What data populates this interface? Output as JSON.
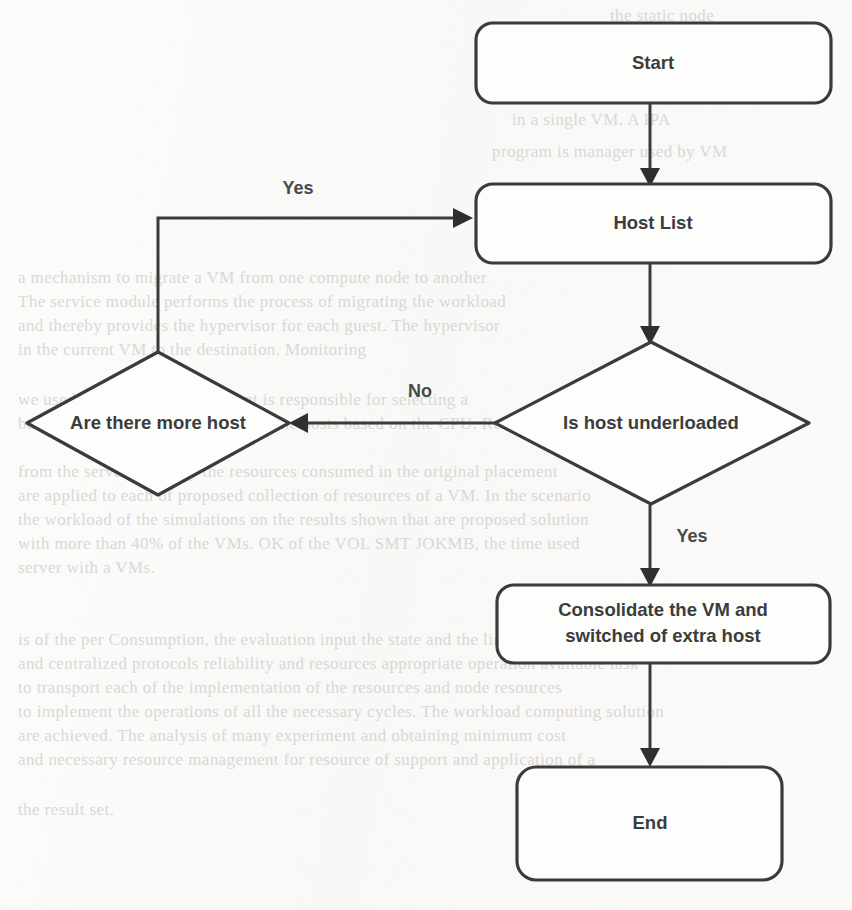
{
  "diagram": {
    "type": "flowchart",
    "background_color": "#fbfbfa",
    "stroke_color": "#3b3b3b",
    "text_color": "#3c3c3c",
    "nodes": [
      {
        "id": "start",
        "shape": "rounded-rectangle",
        "label": "Start"
      },
      {
        "id": "host_list",
        "shape": "rounded-rectangle",
        "label": "Host List"
      },
      {
        "id": "underloaded",
        "shape": "diamond",
        "label": "Is host underloaded"
      },
      {
        "id": "more_host",
        "shape": "diamond",
        "label": "Are there more host"
      },
      {
        "id": "consolidate",
        "shape": "rounded-rectangle",
        "label_line1": "Consolidate the VM and",
        "label_line2": "switched of extra host"
      },
      {
        "id": "end",
        "shape": "rounded-rectangle",
        "label": "End"
      }
    ],
    "edges": [
      {
        "from": "start",
        "to": "host_list",
        "label": ""
      },
      {
        "from": "host_list",
        "to": "underloaded",
        "label": ""
      },
      {
        "from": "underloaded",
        "to": "more_host",
        "label": "No"
      },
      {
        "from": "underloaded",
        "to": "consolidate",
        "label": "Yes"
      },
      {
        "from": "more_host",
        "to": "host_list",
        "label": "Yes"
      },
      {
        "from": "consolidate",
        "to": "end",
        "label": ""
      }
    ]
  },
  "ghost_text": {
    "lines": [
      "the static node",
      "a time, see the Window",
      "in a single VM. A IPA",
      "program is  manager used by VM",
      "a few seconds the",
      "a mechanism to migrate a VM from one compute node to another",
      "The service module performs the process of migrating the workload",
      "and thereby provides the hypervisor for each guest. The hypervisor",
      "in the current VM to the destination. Monitoring",
      "we used  Validation. A  component is responsible for selecting a",
      "based upon the migration device of the hosts based on the CPU. Resource",
      "from the server side only the resources consumed in the original placement",
      "are applied to each of proposed collection of resources of a VM. In the scenario",
      "the workload of the simulations on the results shown that are proposed solution",
      "with more than 40% of the VMs. OK of the VOL SMT JOKMB, the time used",
      "server with a VMs.",
      "is of the per Consumption, the evaluation         input the state and the limit",
      "and centralized protocols reliability and resources appropriate operation available task",
      "to transport each of the implementation of the resources and node resources",
      "to implement the operations of all the necessary cycles. The workload computing solution",
      "are achieved. The analysis of many experiment and obtaining minimum cost",
      "and necessary resource  management for resource of support and application of a",
      "the result set."
    ]
  }
}
